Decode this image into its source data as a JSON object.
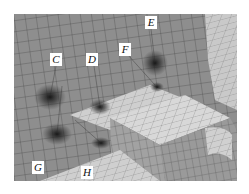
{
  "figure": {
    "colors": {
      "background_plane": "#8e8e8e",
      "light_surface": "#d6d6d6",
      "block_side": "#a8a8a8",
      "mesh_line": "#3a3a3a",
      "hotspot": "#1a1a1a",
      "label_bg": "#ffffff"
    },
    "labels": [
      {
        "id": "C",
        "text": "C",
        "x": 50,
        "y": 53
      },
      {
        "id": "D",
        "text": "D",
        "x": 86,
        "y": 53
      },
      {
        "id": "E",
        "text": "E",
        "x": 145,
        "y": 16
      },
      {
        "id": "F",
        "text": "F",
        "x": 119,
        "y": 43
      },
      {
        "id": "G",
        "text": "G",
        "x": 32,
        "y": 161
      },
      {
        "id": "H",
        "text": "H",
        "x": 81,
        "y": 166
      }
    ],
    "hotspots": [
      {
        "near": "C",
        "cx": 50,
        "cy": 97
      },
      {
        "near": "D",
        "cx": 100,
        "cy": 107
      },
      {
        "near": "E",
        "cx": 155,
        "cy": 63
      },
      {
        "near": "F",
        "cx": 157,
        "cy": 87
      },
      {
        "near": "G",
        "cx": 57,
        "cy": 134
      },
      {
        "near": "H",
        "cx": 101,
        "cy": 143
      }
    ]
  }
}
